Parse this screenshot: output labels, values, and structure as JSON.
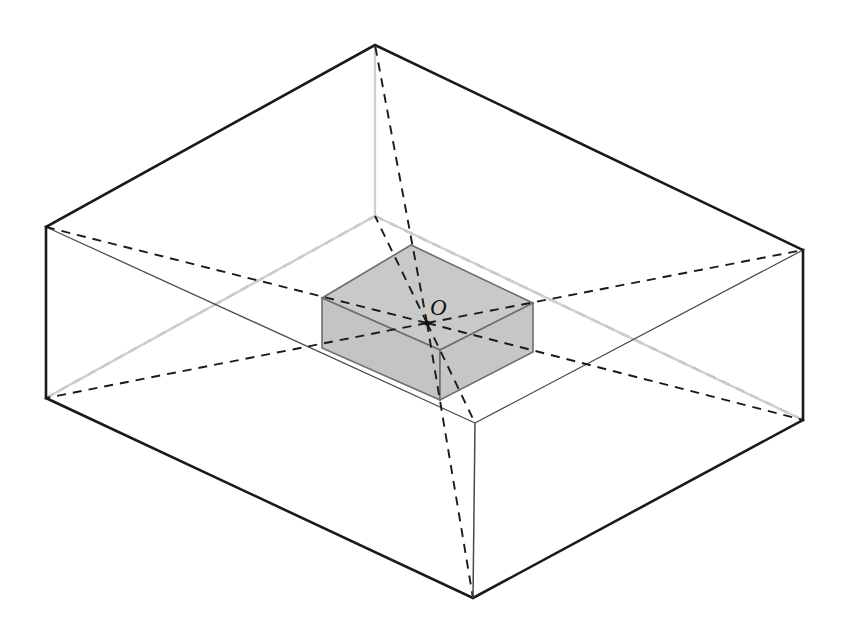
{
  "figure": {
    "type": "3d-geometry-diagram",
    "background_color": "#ffffff",
    "canvas": {
      "width": 850,
      "height": 633
    }
  },
  "labels": {
    "center_point": "O"
  },
  "colors": {
    "outline_strong": "#1a1a1a",
    "outline_thin": "#4a4a4a",
    "hidden_edge_gray": "#cccccc",
    "inner_fill_top": "#c9c9c9",
    "inner_fill_left": "#c4c4c4",
    "inner_fill_right": "#c6c6c6",
    "inner_edge": "#6e6e6e",
    "dashed_line": "#1a1a1a",
    "label_color": "#111111"
  },
  "outer_box": {
    "name": "outer-rectangular-box",
    "vertices": {
      "top_back": [
        375,
        45
      ],
      "top_left": [
        46,
        227
      ],
      "top_right": [
        803,
        250
      ],
      "top_front": [
        475,
        423
      ],
      "bottom_back": [
        375,
        216
      ],
      "bottom_left": [
        46,
        398
      ],
      "bottom_right": [
        803,
        420
      ],
      "bottom_front": [
        473,
        598
      ]
    },
    "visible_edges": [
      "top_back-top_left",
      "top_back-top_right",
      "top_left-top_front",
      "top_right-top_front",
      "top_left-bottom_left",
      "top_right-bottom_right",
      "top_front-bottom_front",
      "bottom_left-bottom_front",
      "bottom_right-bottom_front"
    ],
    "hidden_edges": [
      "top_back-bottom_back",
      "bottom_back-bottom_left",
      "bottom_back-bottom_right"
    ]
  },
  "inner_box": {
    "name": "inner-shaded-prism",
    "vertices": {
      "top_back": [
        411,
        245
      ],
      "top_left": [
        322,
        298
      ],
      "top_right": [
        533,
        303
      ],
      "top_front": [
        440,
        350
      ],
      "bottom_back": [
        411,
        295
      ],
      "bottom_left": [
        322,
        348
      ],
      "bottom_right": [
        533,
        352
      ],
      "bottom_front": [
        440,
        400
      ]
    },
    "faces": [
      "top",
      "left-front",
      "right-front"
    ],
    "shaded": true
  },
  "center": {
    "name": "center-point-O",
    "position": [
      427,
      323
    ],
    "label_position": [
      430,
      315
    ],
    "rays_to": [
      "outer.top_back",
      "outer.top_left",
      "outer.top_right",
      "outer.top_front",
      "outer.bottom_back",
      "outer.bottom_left",
      "outer.bottom_right",
      "outer.bottom_front"
    ],
    "ray_style": "dashed"
  },
  "dash_pattern": {
    "rays": "9 7",
    "hidden_edges": "9 7"
  }
}
